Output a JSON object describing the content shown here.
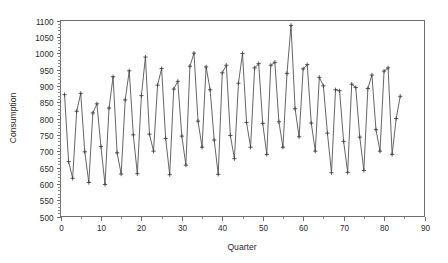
{
  "chart_data": {
    "type": "line",
    "title": "",
    "xlabel": "Quarter",
    "ylabel": "Consumption",
    "xlim": [
      0,
      90
    ],
    "ylim": [
      500,
      1100
    ],
    "xticks": [
      0,
      10,
      20,
      30,
      40,
      50,
      60,
      70,
      80,
      90
    ],
    "yticks": [
      500,
      550,
      600,
      650,
      700,
      750,
      800,
      850,
      900,
      950,
      1000,
      1050,
      1100
    ],
    "xminor_step": 5,
    "yminor_step": 10,
    "grid": false,
    "legend": null,
    "marker": "plus",
    "line_color": "#555555",
    "axis_color": "#6e6e6e",
    "x": [
      1,
      2,
      3,
      4,
      5,
      6,
      7,
      8,
      9,
      10,
      11,
      12,
      13,
      14,
      15,
      16,
      17,
      18,
      19,
      20,
      21,
      22,
      23,
      24,
      25,
      26,
      27,
      28,
      29,
      30,
      31,
      32,
      33,
      34,
      35,
      36,
      37,
      38,
      39,
      40,
      41,
      42,
      43,
      44,
      45,
      46,
      47,
      48,
      49,
      50,
      51,
      52,
      53,
      54,
      55,
      56,
      57,
      58,
      59,
      60,
      61,
      62,
      63,
      64,
      65,
      66,
      67,
      68,
      69,
      70,
      71,
      72,
      73,
      74,
      75,
      76,
      77,
      78,
      79,
      80,
      81,
      82,
      83,
      84
    ],
    "values": [
      873,
      668,
      617,
      822,
      877,
      698,
      604,
      817,
      845,
      714,
      598,
      832,
      928,
      695,
      630,
      857,
      946,
      750,
      631,
      870,
      988,
      752,
      700,
      902,
      953,
      739,
      628,
      890,
      914,
      746,
      657,
      960,
      1000,
      792,
      712,
      958,
      888,
      734,
      629,
      940,
      963,
      748,
      677,
      908,
      999,
      788,
      712,
      955,
      968,
      785,
      690,
      963,
      972,
      790,
      712,
      938,
      1085,
      830,
      744,
      952,
      965,
      786,
      700,
      926,
      900,
      755,
      634,
      888,
      885,
      730,
      635,
      905,
      895,
      743,
      641,
      892,
      933,
      766,
      700,
      945,
      955,
      690,
      800,
      868
    ]
  },
  "axis": {
    "ylabel": "Consumption",
    "xlabel": "Quarter",
    "ytick_labels": [
      "500",
      "550",
      "600",
      "650",
      "700",
      "750",
      "800",
      "850",
      "900",
      "950",
      "1000",
      "1050",
      "1100"
    ],
    "xtick_labels": [
      "0",
      "10",
      "20",
      "30",
      "40",
      "50",
      "60",
      "70",
      "80",
      "90"
    ]
  }
}
